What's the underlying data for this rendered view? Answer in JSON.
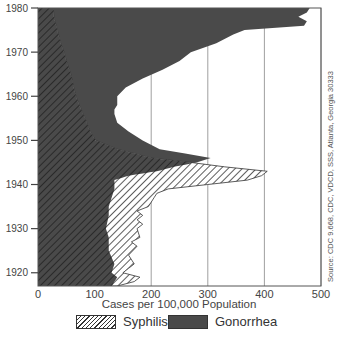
{
  "chart_data": {
    "type": "area",
    "title": "",
    "xlabel": "Cases per 100,000 Population",
    "ylabel": "",
    "orientation": "horizontal (years on vertical axis, cases on horizontal axis)",
    "xlim": [
      0,
      500
    ],
    "ylim": [
      1917,
      1980
    ],
    "x_ticks": [
      "0",
      "100",
      "200",
      "300",
      "400",
      "500"
    ],
    "y_ticks": [
      "1920",
      "1930",
      "1940",
      "1950",
      "1960",
      "1970",
      "1980"
    ],
    "grid": "vertical gridlines at each x tick",
    "legend_position": "bottom",
    "series": [
      {
        "name": "Syphilis",
        "style": "hatched",
        "points": [
          [
            1917,
            140
          ],
          [
            1918,
            170
          ],
          [
            1919,
            180
          ],
          [
            1920,
            150
          ],
          [
            1921,
            160
          ],
          [
            1922,
            170
          ],
          [
            1924,
            160
          ],
          [
            1926,
            175
          ],
          [
            1927,
            165
          ],
          [
            1928,
            180
          ],
          [
            1930,
            175
          ],
          [
            1931,
            185
          ],
          [
            1932,
            175
          ],
          [
            1933,
            185
          ],
          [
            1934,
            175
          ],
          [
            1935,
            195
          ],
          [
            1936,
            200
          ],
          [
            1937,
            205
          ],
          [
            1938,
            210
          ],
          [
            1939,
            230
          ],
          [
            1940,
            300
          ],
          [
            1941,
            370
          ],
          [
            1942,
            395
          ],
          [
            1943,
            405
          ],
          [
            1944,
            330
          ],
          [
            1945,
            270
          ],
          [
            1946,
            200
          ],
          [
            1947,
            170
          ],
          [
            1948,
            140
          ],
          [
            1950,
            102
          ],
          [
            1952,
            92
          ],
          [
            1955,
            83
          ],
          [
            1958,
            73
          ],
          [
            1960,
            67
          ],
          [
            1962,
            63
          ],
          [
            1965,
            58
          ],
          [
            1968,
            50
          ],
          [
            1970,
            46
          ],
          [
            1972,
            40
          ],
          [
            1975,
            34
          ],
          [
            1978,
            28
          ],
          [
            1980,
            27
          ]
        ]
      },
      {
        "name": "Gonorrhea",
        "style": "solid dark",
        "points": [
          [
            1917,
            130
          ],
          [
            1919,
            140
          ],
          [
            1920,
            130
          ],
          [
            1922,
            135
          ],
          [
            1925,
            125
          ],
          [
            1928,
            125
          ],
          [
            1930,
            120
          ],
          [
            1933,
            125
          ],
          [
            1935,
            125
          ],
          [
            1937,
            130
          ],
          [
            1939,
            135
          ],
          [
            1941,
            135
          ],
          [
            1942,
            160
          ],
          [
            1943,
            210
          ],
          [
            1944,
            240
          ],
          [
            1945,
            280
          ],
          [
            1946,
            305
          ],
          [
            1947,
            260
          ],
          [
            1948,
            215
          ],
          [
            1950,
            185
          ],
          [
            1952,
            160
          ],
          [
            1954,
            140
          ],
          [
            1956,
            135
          ],
          [
            1957,
            135
          ],
          [
            1958,
            140
          ],
          [
            1960,
            140
          ],
          [
            1962,
            155
          ],
          [
            1964,
            185
          ],
          [
            1966,
            220
          ],
          [
            1968,
            250
          ],
          [
            1970,
            270
          ],
          [
            1972,
            315
          ],
          [
            1974,
            345
          ],
          [
            1975,
            365
          ],
          [
            1976,
            470
          ],
          [
            1977,
            475
          ],
          [
            1978,
            460
          ],
          [
            1979,
            475
          ],
          [
            1980,
            480
          ]
        ]
      }
    ],
    "annotations": [
      "Source: CDC 9.668, CDC, VDCD, SSS, Atlanta, Georgia 30333"
    ]
  },
  "legend": {
    "syphilis": "Syphilis",
    "gonorrhea": "Gonorrhea"
  },
  "colors": {
    "gonorrhea_fill": "#4a4a4a",
    "hatch_line": "#333333",
    "grid": "#888888"
  }
}
